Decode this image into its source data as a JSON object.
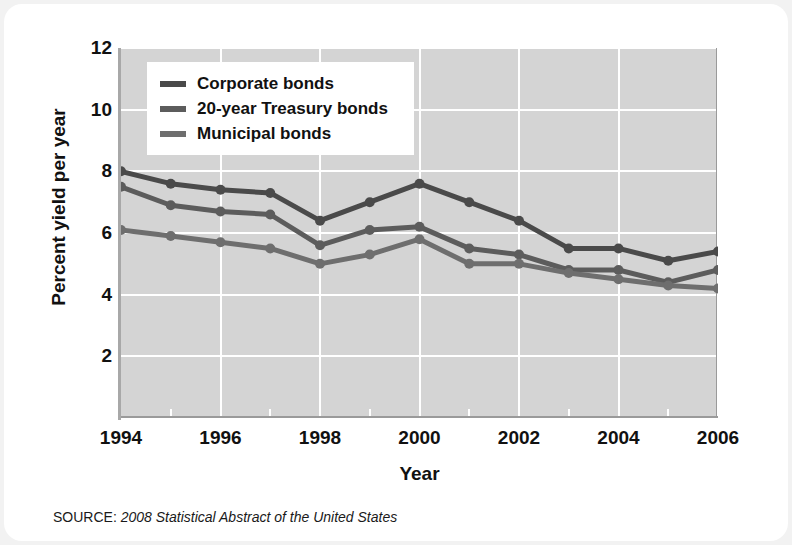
{
  "chart_data": {
    "type": "line",
    "title": "",
    "xlabel": "Year",
    "ylabel": "Percent yield per year",
    "xlim": [
      1994,
      2006
    ],
    "ylim": [
      0,
      12
    ],
    "yticks": [
      2,
      4,
      6,
      8,
      10,
      12
    ],
    "xticks": [
      1994,
      1996,
      1998,
      2000,
      2002,
      2004,
      2006
    ],
    "x": [
      1994,
      1995,
      1996,
      1997,
      1998,
      1999,
      2000,
      2001,
      2002,
      2003,
      2004,
      2005,
      2006
    ],
    "grid": true,
    "legend_position": "top-left",
    "series": [
      {
        "name": "Corporate bonds",
        "color": "#4a4a4a",
        "values": [
          8.0,
          7.6,
          7.4,
          7.3,
          6.4,
          7.0,
          7.6,
          7.0,
          6.4,
          5.5,
          5.5,
          5.1,
          5.4
        ]
      },
      {
        "name": "20-year Treasury bonds",
        "color": "#5c5c5c",
        "values": [
          7.5,
          6.9,
          6.7,
          6.6,
          5.6,
          6.1,
          6.2,
          5.5,
          5.3,
          4.8,
          4.8,
          4.4,
          4.8
        ]
      },
      {
        "name": "Municipal bonds",
        "color": "#6e6e6e",
        "values": [
          6.1,
          5.9,
          5.7,
          5.5,
          5.0,
          5.3,
          5.8,
          5.0,
          5.0,
          4.7,
          4.5,
          4.3,
          4.2
        ]
      }
    ]
  },
  "legend": {
    "items": [
      {
        "label": "Corporate bonds"
      },
      {
        "label": "20-year Treasury bonds"
      },
      {
        "label": "Municipal bonds"
      }
    ]
  },
  "source": {
    "label": "SOURCE: ",
    "title": "2008 Statistical Abstract of the United States"
  },
  "colors": {
    "plot_background": "#d4d4d4",
    "gridline": "#ffffff",
    "page_background": "#ffffff",
    "text": "#111111"
  }
}
